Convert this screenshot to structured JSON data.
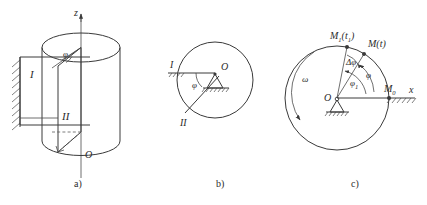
{
  "figure": {
    "caption_a": "a)",
    "caption_b": "b)",
    "caption_c": "c)"
  },
  "panel_a": {
    "axis_z_label": "z",
    "angle_phi_label": "φ",
    "plane_one_label": "I",
    "plane_two_label": "II",
    "origin_label": "O"
  },
  "panel_b": {
    "plane_one_label": "I",
    "plane_two_label": "II",
    "angle_phi_label": "φ",
    "center_label": "O"
  },
  "panel_c": {
    "center_label": "O",
    "axis_x_label": "x",
    "point_m0_label": "M",
    "point_m0_sub": "0",
    "point_m_label": "M(t)",
    "point_m1_label": "M",
    "point_m1_sub": "1",
    "point_m1_arg": "(t",
    "point_m1_arg_sub": "1",
    "point_m1_arg_close": ")",
    "angle_phi_label": "φ",
    "angle_phi1_label": "φ",
    "angle_phi1_sub": "1",
    "angle_delta_phi_label": "Δφ",
    "omega_label": "ω"
  },
  "colors": {
    "line": "#3a3a3a",
    "text": "#2b2b2b",
    "background": "#ffffff"
  }
}
